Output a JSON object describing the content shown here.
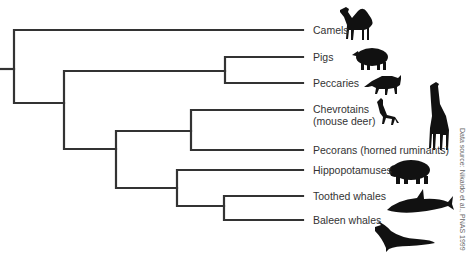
{
  "diagram": {
    "type": "phylogenetic-tree",
    "line_color": "#333333",
    "taxa": [
      {
        "id": "camels",
        "label": "Camels",
        "y": 30
      },
      {
        "id": "pigs",
        "label": "Pigs",
        "y": 57
      },
      {
        "id": "peccaries",
        "label": "Peccaries",
        "y": 83
      },
      {
        "id": "chevrotains",
        "label": "Chevrotains",
        "label2": "(mouse deer)",
        "y": 110
      },
      {
        "id": "pecorans",
        "label": "Pecorans (horned ruminants)",
        "y": 150
      },
      {
        "id": "hippopotamuses",
        "label": "Hippopotamuses",
        "y": 170
      },
      {
        "id": "toothed-whales",
        "label": "Toothed whales",
        "y": 196
      },
      {
        "id": "baleen-whales",
        "label": "Baleen whales",
        "y": 220
      }
    ],
    "tip_x": 303,
    "newick": "(Camels,((Pigs,Peccaries),((Chevrotains,Pecorans),(Hippopotamuses,(Toothed whales,Baleen whales)))));",
    "credit": "Data source: Nikaido et al., PNAS 1999",
    "silhouettes": [
      "camel",
      "pig",
      "peccary",
      "mouse deer",
      "giraffe",
      "hippopotamus",
      "orca",
      "humpback whale"
    ]
  }
}
